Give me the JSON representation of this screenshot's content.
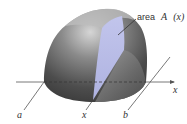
{
  "figure": {
    "annotation": {
      "prefix": "area",
      "symbol": "A",
      "argument": "(x)"
    },
    "axis_label": "x",
    "points": {
      "a": "a",
      "x": "x",
      "b": "b"
    },
    "colors": {
      "solid_dark": "#4a4a4a",
      "solid_mid": "#7a7a7a",
      "solid_light": "#c8c8c8",
      "cross_section": "#b4b8e4",
      "axis": "#555555"
    }
  }
}
